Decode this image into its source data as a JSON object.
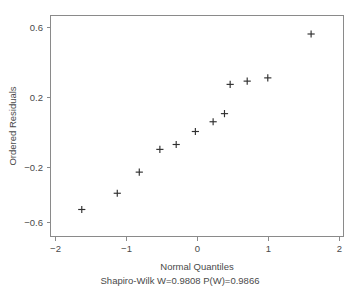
{
  "chart_data": {
    "type": "scatter",
    "title": "",
    "subtitle": "Shapiro-Wilk W=0.9808 P(W)=0.9866",
    "xlabel": "Normal Quantiles",
    "ylabel": "Ordered Residuals",
    "xlim": [
      -2.25,
      2.1
    ],
    "ylim": [
      -0.68,
      0.64
    ],
    "xticks": [
      -2,
      -1,
      0,
      1,
      2
    ],
    "xtick_labels": [
      "−2",
      "−1",
      "0",
      "1",
      "2"
    ],
    "yticks": [
      0.6,
      0.2,
      -0.2,
      -0.6
    ],
    "ytick_labels": [
      "0.6",
      "0.2",
      "−0.2",
      "−0.6"
    ],
    "grid": false,
    "legend": null,
    "marker": "plus",
    "marker_color": "#2f2f2f",
    "frame_color": "#8a8a8a",
    "n_points": 12,
    "x": [
      -1.63,
      -1.13,
      -0.82,
      -0.53,
      -0.3,
      -0.03,
      0.22,
      0.38,
      0.46,
      0.7,
      0.99,
      1.6
    ],
    "y": [
      -0.52,
      -0.42,
      -0.29,
      -0.15,
      -0.12,
      -0.04,
      0.02,
      0.07,
      0.25,
      0.27,
      0.29,
      0.56
    ],
    "points": [
      {
        "x": -1.63,
        "y": -0.52
      },
      {
        "x": -1.13,
        "y": -0.42
      },
      {
        "x": -0.82,
        "y": -0.29
      },
      {
        "x": -0.53,
        "y": -0.15
      },
      {
        "x": -0.3,
        "y": -0.12
      },
      {
        "x": -0.03,
        "y": -0.04
      },
      {
        "x": 0.22,
        "y": 0.02
      },
      {
        "x": 0.38,
        "y": 0.07
      },
      {
        "x": 0.46,
        "y": 0.25
      },
      {
        "x": 0.7,
        "y": 0.27
      },
      {
        "x": 0.99,
        "y": 0.29
      },
      {
        "x": 1.6,
        "y": 0.56
      }
    ]
  },
  "stats": {
    "test_name": "Shapiro-Wilk",
    "w_label": "W",
    "w_value": "0.9808",
    "p_label": "P(W)",
    "p_value": "0.9866"
  },
  "axes": {
    "x_title": "Normal Quantiles",
    "y_title": "Ordered Residuals",
    "x_tick_labels": [
      "−2",
      "−1",
      "0",
      "1",
      "2"
    ],
    "y_tick_labels": [
      "0.6",
      "0.2",
      "−0.2",
      "−0.6"
    ]
  },
  "subtitle_text": "Shapiro-Wilk W=0.9808 P(W)=0.9866"
}
